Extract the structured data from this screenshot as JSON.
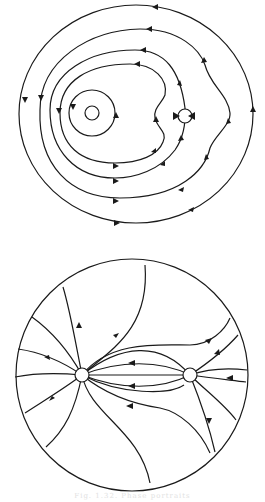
{
  "figure": {
    "top_diagram": {
      "description": "Phase portrait with nested closed orbits around a center and a saddle-like singular point",
      "singular_points": [
        {
          "type": "center",
          "label": "center-left"
        },
        {
          "type": "singular",
          "label": "right-point"
        }
      ],
      "colors": {
        "stroke": "#1a1a1a",
        "background": "#ffffff"
      }
    },
    "bottom_diagram": {
      "description": "Flow lines emanating from a source node (left) to a sink node (right) within a circular disk",
      "singular_points": [
        {
          "type": "source",
          "label": "left-node"
        },
        {
          "type": "node",
          "label": "right-node"
        }
      ],
      "colors": {
        "stroke": "#1a1a1a",
        "background": "#ffffff"
      }
    },
    "caption": "Fig. 1.32. Phase portraits"
  }
}
